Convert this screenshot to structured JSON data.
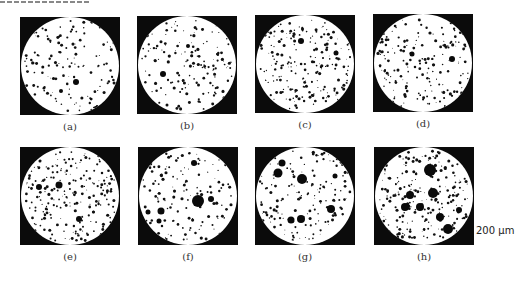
{
  "figure": {
    "panels": [
      {
        "id": "a",
        "label": "(a)",
        "x": 20,
        "y": 17,
        "density": 150,
        "big": [
          [
            55,
            65,
            3
          ],
          [
            40,
            74,
            2
          ]
        ],
        "seed": 11
      },
      {
        "id": "b",
        "label": "(b)",
        "x": 137,
        "y": 16,
        "density": 170,
        "big": [
          [
            25,
            58,
            3
          ],
          [
            50,
            30,
            2
          ]
        ],
        "seed": 23
      },
      {
        "id": "c",
        "label": "(c)",
        "x": 255,
        "y": 15,
        "density": 230,
        "big": [
          [
            45,
            26,
            3
          ],
          [
            80,
            38,
            2.5
          ]
        ],
        "seed": 37
      },
      {
        "id": "d",
        "label": "(d)",
        "x": 373,
        "y": 14,
        "density": 200,
        "big": [
          [
            78,
            45,
            3
          ],
          [
            38,
            40,
            2.5
          ]
        ],
        "seed": 41
      },
      {
        "id": "e",
        "label": "(e)",
        "x": 20,
        "y": 147,
        "density": 240,
        "big": [
          [
            38,
            38,
            3.5
          ],
          [
            58,
            72,
            3
          ],
          [
            18,
            40,
            3
          ]
        ],
        "seed": 53
      },
      {
        "id": "f",
        "label": "(f)",
        "x": 138,
        "y": 147,
        "density": 150,
        "big": [
          [
            59,
            54,
            6
          ],
          [
            72,
            52,
            3
          ],
          [
            22,
            64,
            3.5
          ],
          [
            55,
            16,
            3
          ],
          [
            9,
            65,
            2.5
          ],
          [
            20,
            74,
            2.5
          ]
        ],
        "seed": 61
      },
      {
        "id": "g",
        "label": "(g)",
        "x": 255,
        "y": 147,
        "density": 170,
        "big": [
          [
            26,
            16,
            3.5
          ],
          [
            22,
            26,
            4.5
          ],
          [
            46,
            32,
            5
          ],
          [
            75,
            62,
            4
          ],
          [
            45,
            72,
            4
          ],
          [
            35,
            73,
            3.5
          ],
          [
            79,
            29,
            2.5
          ]
        ],
        "seed": 71
      },
      {
        "id": "h",
        "label": "(h)",
        "x": 374,
        "y": 147,
        "density": 260,
        "big": [
          [
            55,
            23,
            6
          ],
          [
            58,
            46,
            5
          ],
          [
            35,
            48,
            4
          ],
          [
            65,
            70,
            4
          ],
          [
            73,
            82,
            5
          ],
          [
            84,
            63,
            3
          ],
          [
            45,
            60,
            4
          ],
          [
            30,
            60,
            4
          ]
        ],
        "seed": 83
      }
    ],
    "scale_bar": "200 μm"
  }
}
